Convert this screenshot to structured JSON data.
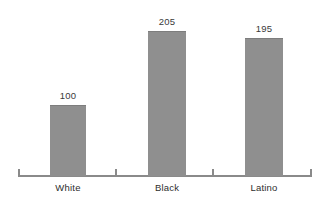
{
  "chart_data": {
    "type": "bar",
    "title": "",
    "subtitle": "",
    "xlabel": "",
    "ylabel": "",
    "categories": [
      "White",
      "Black",
      "Latino"
    ],
    "values": [
      100,
      205,
      195
    ],
    "value_labels": [
      "100",
      "205",
      "195"
    ],
    "series": [
      {
        "name": "",
        "values": [
          100,
          205,
          195
        ]
      }
    ],
    "ylim": [
      0,
      230
    ],
    "grid": false,
    "legend": false,
    "legend_position": "none",
    "bar_color": "#8f8f8f",
    "axis_color": "#8a8a8a",
    "text_color": "#2e2e2e",
    "background_color": "#ffffff",
    "axis_ticks": [
      "left-end",
      "between-1-2",
      "between-2-3",
      "right-end"
    ],
    "annotations": []
  }
}
